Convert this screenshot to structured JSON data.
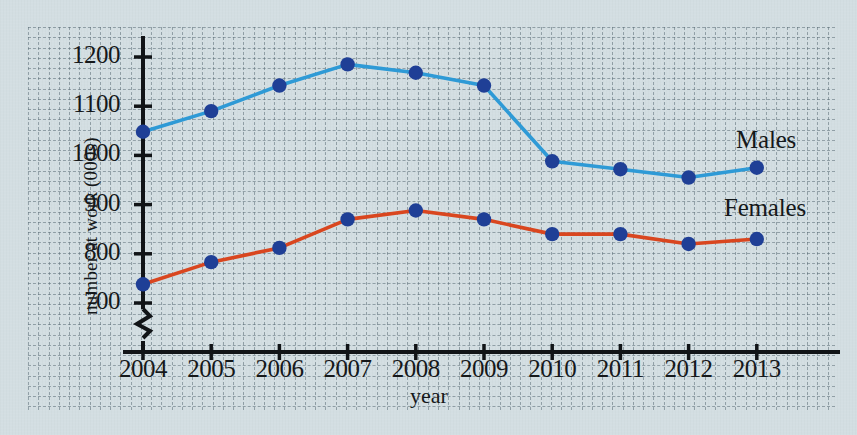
{
  "chart_data": {
    "type": "line",
    "title": "",
    "xlabel": "year",
    "ylabel": "number at work (000s)",
    "categories": [
      "2004",
      "2005",
      "2006",
      "2007",
      "2008",
      "2009",
      "2010",
      "2011",
      "2012",
      "2013"
    ],
    "x": [
      2004,
      2005,
      2006,
      2007,
      2008,
      2009,
      2010,
      2011,
      2012,
      2013
    ],
    "xlim": [
      2003.5,
      2013.6
    ],
    "ylim": [
      655,
      1245
    ],
    "y_axis_break": true,
    "y_axis_break_label": "axis-break-zigzag",
    "yticks": [
      700,
      800,
      900,
      1000,
      1100,
      1200
    ],
    "xticks": [
      "2004",
      "2005",
      "2006",
      "2007",
      "2008",
      "2009",
      "2010",
      "2011",
      "2012",
      "2013"
    ],
    "grid": true,
    "grid_style": "dashed graph paper, minor 10px, major 41px",
    "legend": "inline-right-labels",
    "series": [
      {
        "name": "Males",
        "color": "#2e9ad6",
        "marker_color": "#1f3f96",
        "values": [
          1048,
          1090,
          1142,
          1185,
          1168,
          1142,
          988,
          972,
          955,
          975
        ]
      },
      {
        "name": "Females",
        "color": "#d9461f",
        "marker_color": "#1f3f96",
        "values": [
          738,
          783,
          812,
          870,
          888,
          870,
          840,
          840,
          820,
          830
        ]
      }
    ]
  },
  "axes": {
    "y_tick_labels": [
      "1200",
      "1100",
      "1000",
      "900",
      "800",
      "700"
    ],
    "x_tick_labels": [
      "2004",
      "2005",
      "2006",
      "2007",
      "2008",
      "2009",
      "2010",
      "2011",
      "2012",
      "2013"
    ],
    "y_axis_title": "number at work (000s)",
    "x_axis_title": "year"
  },
  "labels": {
    "males": "Males",
    "females": "Females"
  },
  "colors": {
    "background": "#d3dee2",
    "grid": "#5a6c74",
    "axis": "#111417",
    "males_line": "#2e9ad6",
    "females_line": "#d9461f",
    "marker": "#1f3f96",
    "text": "#15181a"
  }
}
